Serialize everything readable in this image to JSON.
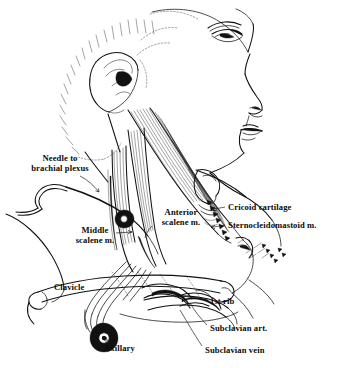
{
  "figure": {
    "style": "black-and-white line drawing",
    "background_color": "#ffffff",
    "ink_color": "#111111"
  },
  "labels": [
    {
      "id": "needle-to-brachial-plexus",
      "text_line1": "Needle to",
      "text_line2": "brachial plexus",
      "x": 14,
      "y": 155,
      "align": "left"
    },
    {
      "id": "middle-scalene",
      "text_line1": "Middle",
      "text_line2": "scalene m.",
      "x": 74,
      "y": 228,
      "align": "left"
    },
    {
      "id": "anterior-scalene",
      "text_line1": "Anterior",
      "text_line2": "scalene m.",
      "x": 157,
      "y": 209,
      "align": "left"
    },
    {
      "id": "cricoid-cartilage",
      "text_line1": "Cricoid cartilage",
      "text_line2": "",
      "x": 227,
      "y": 204,
      "align": "left"
    },
    {
      "id": "sternocleidomastoid",
      "text_line1": "Sternocleidomastoid m.",
      "text_line2": "",
      "x": 227,
      "y": 222,
      "align": "left"
    },
    {
      "id": "clavicle",
      "text_line1": "Clavicle",
      "text_line2": "",
      "x": 53,
      "y": 284,
      "align": "left"
    },
    {
      "id": "first-rib",
      "text_line1": "1st rib",
      "text_line2": "",
      "x": 209,
      "y": 299,
      "align": "left"
    },
    {
      "id": "subclavian-artery",
      "text_line1": "Subclavian art.",
      "text_line2": "",
      "x": 209,
      "y": 326,
      "align": "left"
    },
    {
      "id": "subclavian-vein",
      "text_line1": "Subclavian vein",
      "text_line2": "",
      "x": 204,
      "y": 348,
      "align": "left"
    },
    {
      "id": "axillary",
      "text_line1": "Axillary",
      "text_line2": "",
      "x": 104,
      "y": 345,
      "align": "left"
    }
  ],
  "anatomy_parts": [
    "head-profile",
    "eye",
    "nose",
    "lips",
    "chin",
    "ear",
    "hairline",
    "sternocleidomastoid-muscle",
    "anterior-scalene-muscle",
    "middle-scalene-muscle",
    "thyroid-cartilage",
    "cricoid-cartilage",
    "clavicle",
    "first-rib",
    "subclavian-artery",
    "subclavian-vein",
    "brachial-plexus-trunks",
    "axillary-vessels",
    "needle",
    "needle-tubing",
    "shoulder-contour"
  ]
}
